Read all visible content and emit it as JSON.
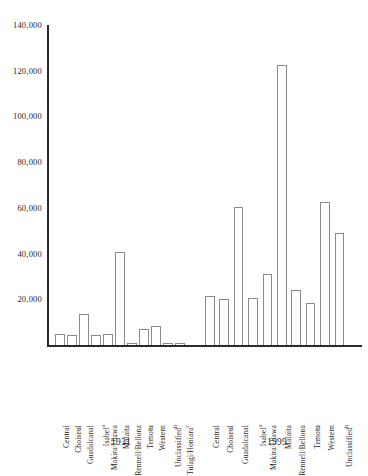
{
  "chart_data": {
    "type": "bar",
    "title": "",
    "xlabel": "",
    "ylabel": "",
    "ylim": [
      0,
      140000
    ],
    "ytick_labels": [
      "140,000",
      "120,000",
      "100,000",
      "80,000",
      "60,000",
      "40,000",
      "20,000"
    ],
    "ytick_values": [
      140000,
      120000,
      100000,
      80000,
      60000,
      40000,
      20000
    ],
    "grid": false,
    "legend": "none",
    "categories": [
      "Central",
      "Choiseul",
      "Guadalcanal",
      "Isabel",
      "Makira/Ulawa",
      "Malaita",
      "Rennell/Bellona",
      "Temotu",
      "Western",
      "Unclassified",
      "Tulagi/Honiara"
    ],
    "category_superscripts": {
      "Isabel": "a",
      "Unclassified": "b",
      "Tulagi/Honiara": "c"
    },
    "groups": [
      {
        "label": "1931",
        "categories": [
          "Central",
          "Choiseul",
          "Guadalcanal",
          "Isabel",
          "Makira/Ulawa",
          "Malaita",
          "Rennell/Bellona",
          "Temotu",
          "Western",
          "Unclassified",
          "Tulagi/Honiara"
        ],
        "values": [
          5000,
          4600,
          13500,
          4500,
          5000,
          40500,
          1100,
          7000,
          8500,
          1100,
          700
        ]
      },
      {
        "label": "1999",
        "categories": [
          "Central",
          "Choiseul",
          "Guadalcanal",
          "Isabel",
          "Makira/Ulawa",
          "Malaita",
          "Rennell/Bellona",
          "Temotu",
          "Western",
          "Unclassified"
        ],
        "values": [
          21500,
          20000,
          60500,
          20500,
          31000,
          122500,
          24000,
          18500,
          62500,
          49000
        ]
      }
    ],
    "series": [
      {
        "name": "1931",
        "values": [
          5000,
          4600,
          13500,
          4500,
          5000,
          40500,
          1100,
          7000,
          8500,
          1100,
          700
        ]
      },
      {
        "name": "1999",
        "values": [
          21500,
          20000,
          60500,
          20500,
          31000,
          122500,
          24000,
          18500,
          62500,
          49000,
          null
        ]
      }
    ],
    "colors": {
      "bar_fill": "#ffffff",
      "bar_stroke": "#8a8a8a",
      "axis": "#2b2b2b",
      "text": "#1f1f1f",
      "background": "#ffffff"
    }
  },
  "axis": {
    "y_max_label": "140,000",
    "y_min_label": "0"
  },
  "group_labels": [
    "1931",
    "1999"
  ],
  "page_artifact": "·"
}
